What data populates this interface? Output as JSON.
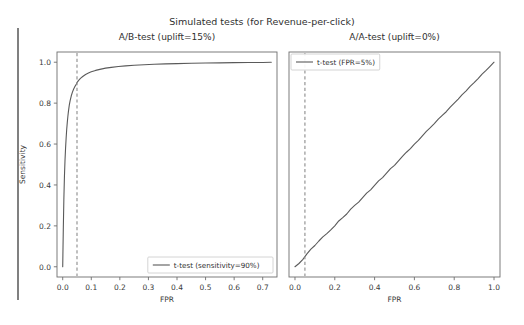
{
  "figure": {
    "suptitle": "Simulated tests (for Revenue-per-click)",
    "width": 524,
    "height": 325,
    "background": "#ffffff",
    "line_color": "#5a5a5a",
    "dashed_color": "#8c8c8c",
    "axis_color": "#6e6e6e"
  },
  "chart_data": [
    {
      "type": "line",
      "title": "A/B-test (uplift=15%)",
      "xlabel": "FPR",
      "ylabel": "Sensitivity",
      "xlim": [
        -0.02,
        0.75
      ],
      "ylim": [
        -0.05,
        1.05
      ],
      "grid": false,
      "legend_position": "lower right",
      "xticks": [
        "0.0",
        "0.1",
        "0.2",
        "0.3",
        "0.4",
        "0.5",
        "0.6",
        "0.7"
      ],
      "xtick_values": [
        0.0,
        0.1,
        0.2,
        0.3,
        0.4,
        0.5,
        0.6,
        0.7
      ],
      "yticks": [
        "0.0",
        "0.2",
        "0.4",
        "0.6",
        "0.8",
        "1.0"
      ],
      "ytick_values": [
        0.0,
        0.2,
        0.4,
        0.6,
        0.8,
        1.0
      ],
      "series": [
        {
          "name": "t-test (sensitivity=90%)",
          "style": "solid",
          "x": [
            0.0,
            0.002,
            0.004,
            0.006,
            0.008,
            0.01,
            0.012,
            0.014,
            0.016,
            0.018,
            0.02,
            0.023,
            0.026,
            0.03,
            0.034,
            0.038,
            0.043,
            0.048,
            0.05,
            0.055,
            0.062,
            0.07,
            0.08,
            0.09,
            0.1,
            0.115,
            0.13,
            0.15,
            0.17,
            0.195,
            0.22,
            0.25,
            0.285,
            0.32,
            0.36,
            0.4,
            0.45,
            0.5,
            0.55,
            0.6,
            0.65,
            0.7,
            0.73
          ],
          "y": [
            0.0,
            0.18,
            0.33,
            0.44,
            0.52,
            0.58,
            0.63,
            0.672,
            0.706,
            0.735,
            0.76,
            0.79,
            0.812,
            0.836,
            0.854,
            0.868,
            0.882,
            0.894,
            0.9,
            0.91,
            0.921,
            0.93,
            0.94,
            0.947,
            0.953,
            0.96,
            0.965,
            0.971,
            0.975,
            0.979,
            0.982,
            0.985,
            0.988,
            0.99,
            0.992,
            0.993,
            0.995,
            0.996,
            0.997,
            0.998,
            0.999,
            0.999,
            1.0
          ]
        },
        {
          "name": "FPR threshold",
          "style": "dashed-vertical",
          "x_value": 0.05
        }
      ],
      "annotations": {
        "threshold_fpr": 0.05,
        "sensitivity_at_threshold": 0.9
      }
    },
    {
      "type": "line",
      "title": "A/A-test (uplift=0%)",
      "xlabel": "FPR",
      "ylabel": "",
      "xlim": [
        -0.03,
        1.03
      ],
      "ylim": [
        -0.05,
        1.05
      ],
      "grid": false,
      "legend_position": "upper left",
      "xticks": [
        "0.0",
        "0.2",
        "0.4",
        "0.6",
        "0.8",
        "1.0"
      ],
      "xtick_values": [
        0.0,
        0.2,
        0.4,
        0.6,
        0.8,
        1.0
      ],
      "yticks": [],
      "ytick_values": [],
      "series": [
        {
          "name": "t-test (FPR=5%)",
          "style": "solid",
          "x": [
            0.0,
            0.02,
            0.04,
            0.05,
            0.06,
            0.08,
            0.1,
            0.12,
            0.14,
            0.16,
            0.18,
            0.2,
            0.22,
            0.24,
            0.26,
            0.28,
            0.3,
            0.32,
            0.34,
            0.36,
            0.38,
            0.4,
            0.42,
            0.44,
            0.46,
            0.48,
            0.5,
            0.52,
            0.54,
            0.56,
            0.58,
            0.6,
            0.62,
            0.64,
            0.66,
            0.68,
            0.7,
            0.72,
            0.74,
            0.76,
            0.78,
            0.8,
            0.82,
            0.84,
            0.86,
            0.88,
            0.9,
            0.92,
            0.94,
            0.96,
            0.98,
            1.0
          ],
          "y": [
            0.0,
            0.016,
            0.036,
            0.05,
            0.063,
            0.086,
            0.104,
            0.126,
            0.146,
            0.162,
            0.18,
            0.2,
            0.224,
            0.24,
            0.258,
            0.282,
            0.3,
            0.316,
            0.338,
            0.36,
            0.376,
            0.398,
            0.42,
            0.436,
            0.458,
            0.48,
            0.496,
            0.518,
            0.54,
            0.56,
            0.578,
            0.6,
            0.618,
            0.64,
            0.662,
            0.68,
            0.7,
            0.722,
            0.74,
            0.758,
            0.78,
            0.8,
            0.82,
            0.842,
            0.86,
            0.882,
            0.9,
            0.92,
            0.942,
            0.96,
            0.98,
            1.0
          ]
        },
        {
          "name": "FPR threshold",
          "style": "dashed-vertical",
          "x_value": 0.05
        }
      ],
      "annotations": {
        "threshold_fpr": 0.05
      }
    }
  ]
}
